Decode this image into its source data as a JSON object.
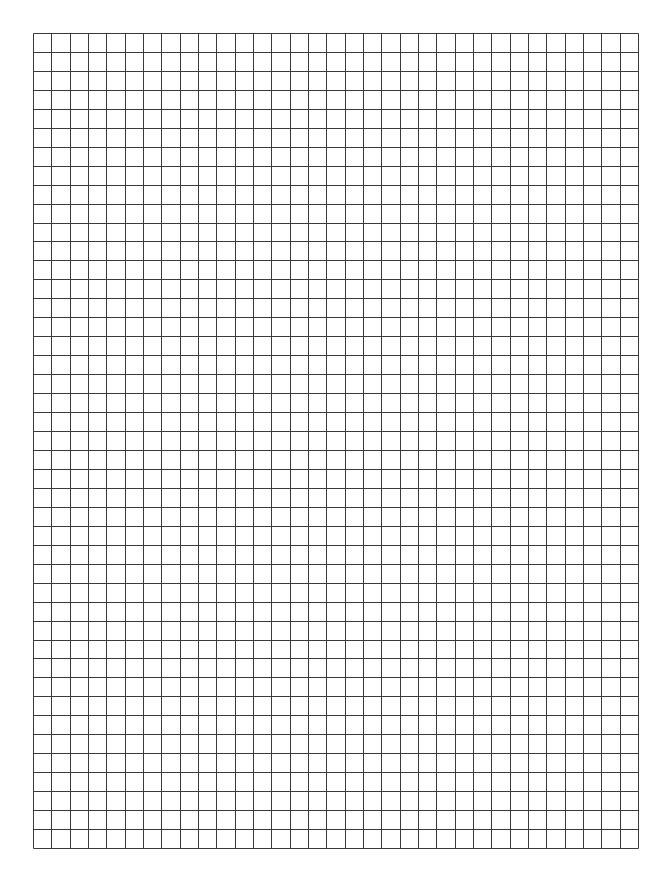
{
  "page": {
    "type": "graph-paper",
    "background_color": "#ffffff"
  },
  "grid": {
    "left": 33,
    "top": 32.5,
    "width": 605,
    "height": 815,
    "columns": 33,
    "rows": 43,
    "line_color": "#3a3a3a",
    "line_width": 1
  }
}
